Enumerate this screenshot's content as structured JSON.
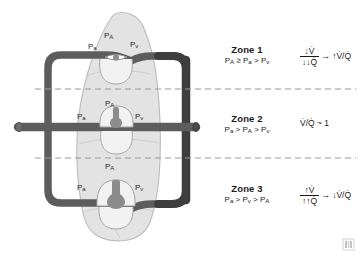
{
  "figure": {
    "colors": {
      "lung_fill": "#e3e3e3",
      "lung_stroke": "#b9b9b9",
      "vessel_dark": "#5a5a5a",
      "vessel_darker": "#3b3b3b",
      "capillary_fill": "#f2f2f2",
      "capillary_stroke": "#9a9a9a",
      "blood": "#8c8c8c",
      "dashed_line": "#9a9a9a",
      "text": "#1b1b1b"
    }
  },
  "zones": [
    {
      "id": "zone-1",
      "title": "Zone 1",
      "relation_parts": [
        "P",
        "A",
        " ≥ P",
        "a",
        " > P",
        "v"
      ],
      "relation_plain": "PA ≥ Pa > Pv",
      "formula": {
        "numerator": "↓V̇",
        "denominator": "↓↓Q̇",
        "arrow": "→",
        "result": "↑V̇/Q̇"
      }
    },
    {
      "id": "zone-2",
      "title": "Zone 2",
      "relation_parts": [
        "P",
        "a",
        " > P",
        "A",
        " > P",
        "v"
      ],
      "relation_plain": "Pa > PA > Pv",
      "formula": {
        "simple": "V̇/Q̇ ~ 1"
      }
    },
    {
      "id": "zone-3",
      "title": "Zone 3",
      "relation_parts": [
        "P",
        "a",
        " > P",
        "v",
        " > P",
        "A"
      ],
      "relation_plain": "Pa > Pv > PA",
      "formula": {
        "numerator": "↑V̇",
        "denominator": "↑↑Q̇",
        "arrow": "→",
        "result": "↓V̇/Q̇"
      }
    }
  ],
  "vessel_labels": [
    {
      "id": "zone1-pa-arterial",
      "main": "P",
      "sub": "a",
      "x": 88,
      "y": 48
    },
    {
      "id": "zone1-pa-alveolar",
      "main": "P",
      "sub": "A",
      "x": 106,
      "y": 38
    },
    {
      "id": "zone1-pv-venous",
      "main": "P",
      "sub": "v",
      "x": 129,
      "y": 46
    },
    {
      "id": "zone2-pa-arterial",
      "main": "P",
      "sub": "a",
      "x": 79,
      "y": 117
    },
    {
      "id": "zone2-pa-alveolar",
      "main": "P",
      "sub": "A",
      "x": 105,
      "y": 105
    },
    {
      "id": "zone2-pv-venous",
      "main": "P",
      "sub": "v",
      "x": 134,
      "y": 117
    },
    {
      "id": "zone3-pa-arterial",
      "main": "P",
      "sub": "a",
      "x": 79,
      "y": 186
    },
    {
      "id": "zone3-pa-alveolar",
      "main": "P",
      "sub": "A",
      "x": 105,
      "y": 165
    },
    {
      "id": "zone3-pv-venous",
      "main": "P",
      "sub": "v",
      "x": 134,
      "y": 186
    }
  ],
  "dividers": [
    {
      "id": "divider-zone1-zone2",
      "y": 89
    },
    {
      "id": "divider-zone2-zone3",
      "y": 158
    }
  ]
}
